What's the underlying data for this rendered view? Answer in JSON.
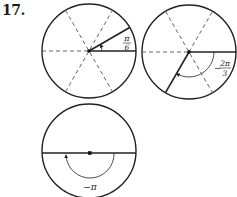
{
  "problem_number": "17.",
  "figures": [
    {
      "id": "circle-1",
      "angle_label_num": "π",
      "angle_label_den": "6",
      "angle_label_sign": "",
      "description": "Unit circle divided into 6 sectors by dashed diameters; terminal side at pi/6 counter-clockwise from positive x-axis"
    },
    {
      "id": "circle-2",
      "angle_label_num": "2π",
      "angle_label_den": "3",
      "angle_label_sign": "−",
      "description": "Unit circle with dashed diameters; terminal side at -2pi/3, arc drawn clockwise"
    },
    {
      "id": "circle-3",
      "angle_label": "−π",
      "description": "Circle with horizontal diameter; arc drawn clockwise half-turn to negative x-axis"
    }
  ],
  "colors": {
    "ink": "#222222",
    "dashed": "#555555",
    "background": "#ffffff"
  }
}
